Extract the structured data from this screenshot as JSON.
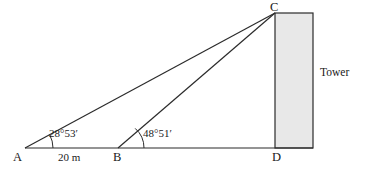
{
  "diagram": {
    "type": "geometry-figure",
    "stroke_color": "#2b2b2b",
    "tower_fill_color": "#e8e8e8",
    "vertices": {
      "A": {
        "label": "A",
        "x": 25,
        "y": 148
      },
      "B": {
        "label": "B",
        "x": 118,
        "y": 148
      },
      "C": {
        "label": "C",
        "x": 275,
        "y": 13
      },
      "D": {
        "label": "D",
        "x": 275,
        "y": 148
      }
    },
    "angles": [
      {
        "at": "A",
        "label": "28°53′",
        "degrees": 28,
        "minutes": 53
      },
      {
        "at": "B",
        "label": "48°51′",
        "degrees": 48,
        "minutes": 51
      }
    ],
    "measures": [
      {
        "segment": "AB",
        "label": "20 m",
        "value": 20,
        "unit": "m"
      }
    ],
    "objects": [
      {
        "name": "tower",
        "label": "Tower",
        "shape": "rectangle",
        "x": 275,
        "y": 13,
        "width": 38,
        "height": 135
      }
    ],
    "segments": [
      {
        "from": "A",
        "to": "D",
        "name": "baseline"
      },
      {
        "from": "A",
        "to": "C",
        "name": "line-of-sight-a"
      },
      {
        "from": "B",
        "to": "C",
        "name": "line-of-sight-b"
      }
    ]
  }
}
